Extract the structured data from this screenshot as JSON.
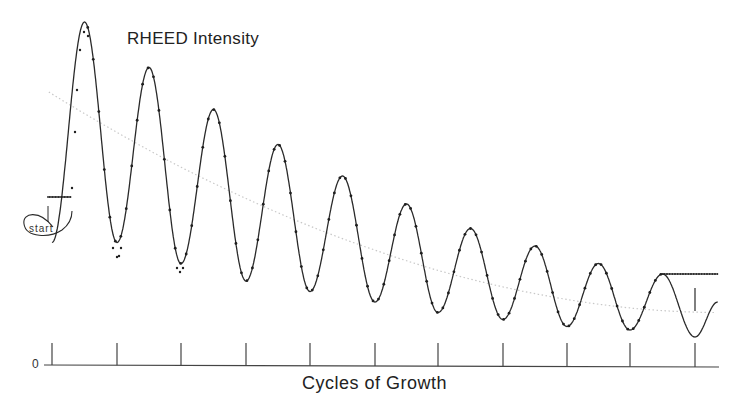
{
  "chart_data": {
    "type": "line",
    "title": "RHEED Intensity",
    "xlabel": "Cycles of Growth",
    "ylabel": "",
    "y_origin_label": "0",
    "annotations": [
      "start"
    ],
    "x_ticks": [
      0,
      1,
      2,
      3,
      4,
      5,
      6,
      7,
      8,
      9,
      10
    ],
    "xlim": [
      0,
      10.4
    ],
    "ylim": [
      0,
      1
    ],
    "grid": false,
    "legend": null,
    "series": [
      {
        "name": "measured (points)",
        "style": "dots",
        "peaks": [
          {
            "cycle": 0.5,
            "intensity": 0.98
          },
          {
            "cycle": 1.5,
            "intensity": 0.85
          },
          {
            "cycle": 2.5,
            "intensity": 0.73
          },
          {
            "cycle": 3.5,
            "intensity": 0.63
          },
          {
            "cycle": 4.5,
            "intensity": 0.54
          },
          {
            "cycle": 5.5,
            "intensity": 0.46
          },
          {
            "cycle": 6.5,
            "intensity": 0.39
          },
          {
            "cycle": 7.5,
            "intensity": 0.34
          },
          {
            "cycle": 8.5,
            "intensity": 0.29
          },
          {
            "cycle": 9.5,
            "intensity": 0.26
          }
        ],
        "troughs": [
          {
            "cycle": 1.0,
            "intensity": 0.35
          },
          {
            "cycle": 2.0,
            "intensity": 0.29
          },
          {
            "cycle": 3.0,
            "intensity": 0.24
          },
          {
            "cycle": 4.0,
            "intensity": 0.21
          },
          {
            "cycle": 5.0,
            "intensity": 0.18
          },
          {
            "cycle": 6.0,
            "intensity": 0.15
          },
          {
            "cycle": 7.0,
            "intensity": 0.13
          },
          {
            "cycle": 8.0,
            "intensity": 0.11
          },
          {
            "cycle": 9.0,
            "intensity": 0.1
          }
        ],
        "initial_plateau": 0.48,
        "final_plateau": 0.26
      },
      {
        "name": "fit (solid)",
        "style": "line",
        "final_trough": {
          "cycle": 10.0,
          "intensity": 0.08
        }
      },
      {
        "name": "background trend (dotted)",
        "style": "dotted",
        "start": {
          "cycle": -0.05,
          "intensity": 0.78
        },
        "end": {
          "cycle": 10.35,
          "intensity": 0.15
        }
      }
    ]
  },
  "layout": {
    "axis_y_px": 365,
    "tick_x_px": [
      52,
      117,
      181,
      246,
      310,
      375,
      438,
      503,
      567,
      630,
      695
    ],
    "axis_x_start": 44,
    "axis_x_end": 719,
    "tick_top_px": 343
  },
  "colors": {
    "line": "#2a2a2a",
    "dots": "#1e1e1e",
    "trend": "#c8c8c8",
    "axis": "#444444"
  }
}
